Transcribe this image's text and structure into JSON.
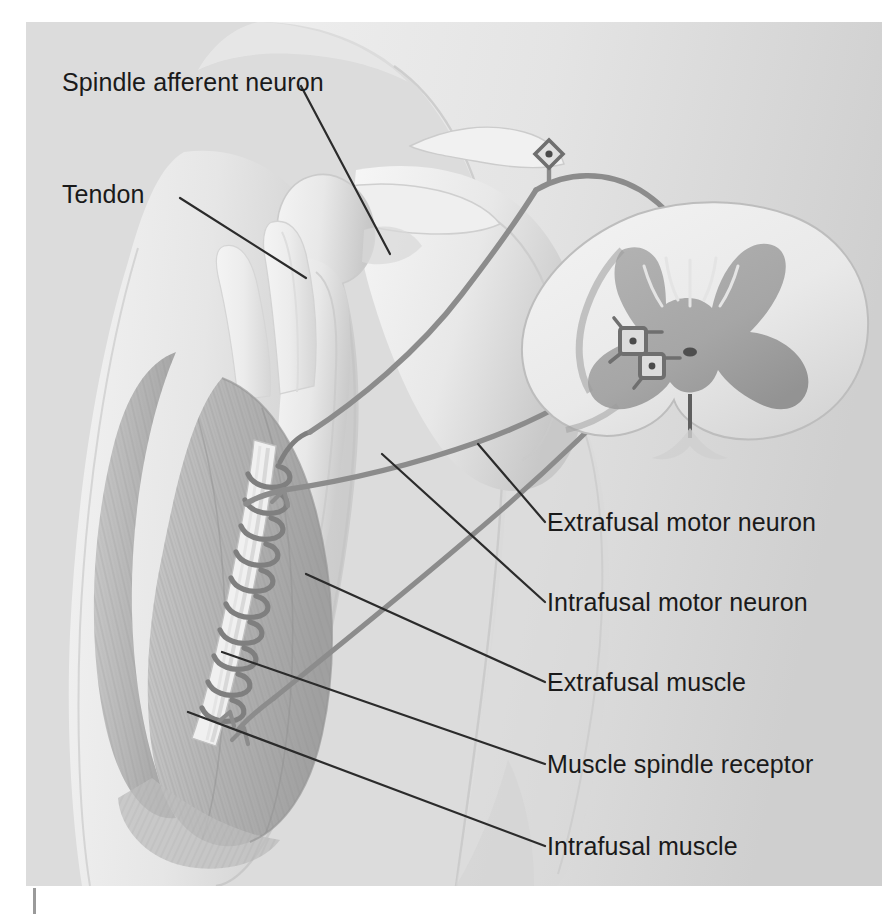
{
  "figure": {
    "background_color": "#dcdcdc",
    "page_color": "#ffffff",
    "label_color": "#1a1a1a",
    "nerve_color": "#8c8c8c",
    "gray_matter_color": "#a8a8a8",
    "leader_color": "#2b2b2b"
  },
  "labels": [
    {
      "id": "spindle-afferent-neuron",
      "text": "Spindle afferent neuron",
      "x": 36,
      "y": 58
    },
    {
      "id": "tendon",
      "text": "Tendon",
      "x": 36,
      "y": 170
    },
    {
      "id": "extrafusal-motor-neuron",
      "text": "Extrafusal motor neuron",
      "x": 521,
      "y": 500
    },
    {
      "id": "intrafusal-motor-neuron",
      "text": "Intrafusal motor neuron",
      "x": 521,
      "y": 580
    },
    {
      "id": "extrafusal-muscle",
      "text": "Extrafusal muscle",
      "x": 521,
      "y": 660
    },
    {
      "id": "muscle-spindle-receptor",
      "text": "Muscle spindle receptor",
      "x": 521,
      "y": 742
    },
    {
      "id": "intrafusal-muscle",
      "text": "Intrafusal muscle",
      "x": 521,
      "y": 824
    }
  ],
  "structures": [
    {
      "id": "spinal-cord",
      "name": "Spinal cord cross-section"
    },
    {
      "id": "gray-matter",
      "name": "Gray matter butterfly"
    },
    {
      "id": "central-canal",
      "name": "Central canal"
    },
    {
      "id": "dorsal-root-ganglion",
      "name": "Dorsal root ganglion cell body"
    },
    {
      "id": "alpha-motor-neuron-soma",
      "name": "Alpha motor neuron cell body"
    },
    {
      "id": "gamma-motor-neuron-soma",
      "name": "Gamma motor neuron cell body"
    },
    {
      "id": "scapula",
      "name": "Scapula"
    },
    {
      "id": "clavicle",
      "name": "Clavicle"
    },
    {
      "id": "humerus",
      "name": "Humerus"
    },
    {
      "id": "biceps-muscle",
      "name": "Biceps brachii muscle belly"
    },
    {
      "id": "muscle-spindle",
      "name": "Muscle spindle with annulospiral ending"
    },
    {
      "id": "motor-end-plate",
      "name": "Motor end plate"
    }
  ]
}
